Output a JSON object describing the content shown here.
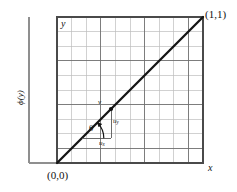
{
  "figure": {
    "title_none": "",
    "type": "unit-square-grid-diagram",
    "background": "#ffffff",
    "grid": {
      "divisions": 10,
      "x_left_px": 57,
      "y_top_px": 17,
      "x_right_px": 203,
      "y_bottom_px": 163,
      "minor_color": "#b9b9b9",
      "major_color": "#6e6e6e",
      "border_color": "#4a4a4a"
    },
    "diagonal": {
      "from": [
        0,
        0
      ],
      "to": [
        1,
        1
      ],
      "color": "#1a1a1a",
      "width_px": 2.2
    },
    "axes_bracket": {
      "color": "#8a8a8a",
      "vertical_x_px": 29,
      "top_y_px": 17,
      "bottom_y_px": 163,
      "right_x_px": 57
    },
    "point_v": {
      "x": 0.37,
      "y": 0.37
    },
    "components": {
      "ux_from": [
        0.17,
        0.17
      ],
      "ux_to": [
        0.37,
        0.17
      ],
      "uy_from": [
        0.37,
        0.17
      ],
      "uy_to": [
        0.37,
        0.37
      ],
      "color": "#555555"
    },
    "angle_arc": {
      "vertex": [
        0.17,
        0.17
      ],
      "radius_px": 20,
      "start_deg": 0,
      "end_deg": 45
    }
  },
  "labels": {
    "origin": "(0,0)",
    "top_right": "(1,1)",
    "x_axis": "x",
    "y_axis": "y",
    "phi_axis": "ϕ(y)",
    "point_v": "v",
    "u_x_base": "u",
    "u_x_sub": "x",
    "u_y_base": "u",
    "u_y_sub": "y",
    "theta": "θ"
  }
}
